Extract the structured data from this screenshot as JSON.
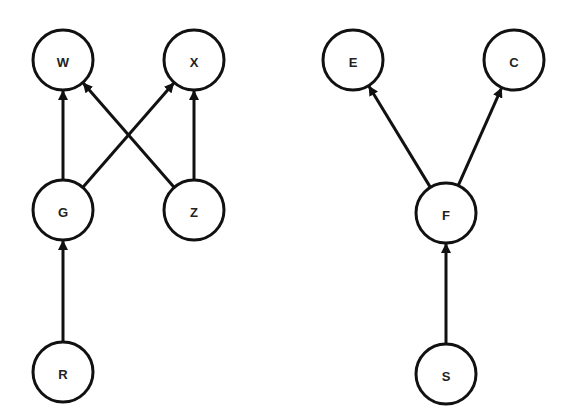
{
  "diagram": {
    "type": "directed-graph",
    "colors": {
      "stroke": "#111111",
      "fill": "#ffffff",
      "text": "#222222"
    },
    "node_radius": 30,
    "graphs": [
      {
        "name": "left-graph",
        "nodes": [
          "W",
          "X",
          "G",
          "Z",
          "R"
        ]
      },
      {
        "name": "right-graph",
        "nodes": [
          "E",
          "C",
          "F",
          "S"
        ]
      }
    ],
    "nodes": [
      {
        "id": "W",
        "label": "W",
        "x": 63,
        "y": 60
      },
      {
        "id": "X",
        "label": "X",
        "x": 194,
        "y": 60
      },
      {
        "id": "G",
        "label": "G",
        "x": 63,
        "y": 210
      },
      {
        "id": "Z",
        "label": "Z",
        "x": 194,
        "y": 210
      },
      {
        "id": "R",
        "label": "R",
        "x": 63,
        "y": 372
      },
      {
        "id": "E",
        "label": "E",
        "x": 353,
        "y": 60
      },
      {
        "id": "C",
        "label": "C",
        "x": 514,
        "y": 60
      },
      {
        "id": "F",
        "label": "F",
        "x": 446,
        "y": 213
      },
      {
        "id": "S",
        "label": "S",
        "x": 446,
        "y": 374
      }
    ],
    "edges": [
      {
        "from": "G",
        "to": "W"
      },
      {
        "from": "G",
        "to": "X"
      },
      {
        "from": "Z",
        "to": "W"
      },
      {
        "from": "Z",
        "to": "X"
      },
      {
        "from": "R",
        "to": "G"
      },
      {
        "from": "F",
        "to": "E"
      },
      {
        "from": "F",
        "to": "C"
      },
      {
        "from": "S",
        "to": "F"
      }
    ]
  }
}
